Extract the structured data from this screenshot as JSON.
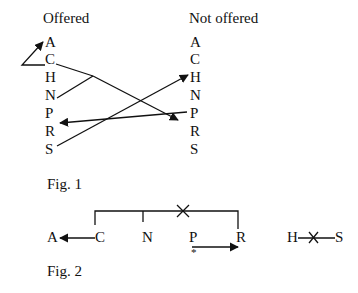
{
  "fig1": {
    "left_header": "Offered",
    "right_header": "Not offered",
    "left_letters": [
      "A",
      "C",
      "H",
      "N",
      "P",
      "R",
      "S"
    ],
    "right_letters": [
      "A",
      "C",
      "H",
      "N",
      "P",
      "R",
      "S"
    ],
    "caption": "Fig. 1"
  },
  "fig2": {
    "letters": {
      "a": "A",
      "c": "C",
      "n": "N",
      "p": "P",
      "r": "R",
      "h": "H",
      "s": "S"
    },
    "star": "*",
    "caption": "Fig. 2"
  },
  "ink_color": "#111111"
}
